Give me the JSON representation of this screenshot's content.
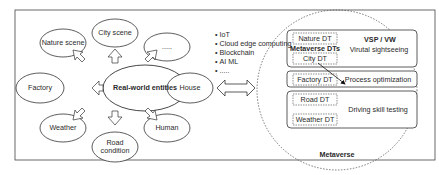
{
  "diagram": {
    "center": "Real-world entities",
    "entities": [
      {
        "id": "nature",
        "label": "Nature scene"
      },
      {
        "id": "city",
        "label": "City scene"
      },
      {
        "id": "more",
        "label": "....."
      },
      {
        "id": "factory",
        "label": "Factory"
      },
      {
        "id": "house",
        "label": "House"
      },
      {
        "id": "weather",
        "label": "Weather"
      },
      {
        "id": "road",
        "label_line1": "Road",
        "label_line2": "condition"
      },
      {
        "id": "human",
        "label": "Human"
      }
    ],
    "technologies": [
      "IoT",
      "Cloud edge computing",
      "Blockchain",
      "AI ML",
      "....."
    ],
    "metaverse": {
      "title": "Metaverse",
      "dts_label": "Metaverse DTs",
      "groups": [
        {
          "dts": [
            "Nature DT",
            "City DT"
          ],
          "header": "VSP / VW",
          "application": "Virutal sightseeing"
        },
        {
          "dts": [
            "Factory DT"
          ],
          "application": "Process optimization"
        },
        {
          "dts": [
            "Road DT",
            "Weather DT"
          ],
          "application": "Driving skill testing"
        }
      ]
    }
  }
}
